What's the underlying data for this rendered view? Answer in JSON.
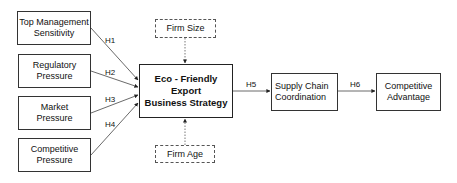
{
  "diagram": {
    "nodes": {
      "top_management": {
        "line1": "Top Management",
        "line2": "Sensitivity"
      },
      "regulatory": {
        "line1": "Regulatory",
        "line2": "Pressure"
      },
      "market": {
        "line1": "Market",
        "line2": "Pressure"
      },
      "competitive_pressure": {
        "line1": "Competitive",
        "line2": "Pressure"
      },
      "eco_strategy": {
        "line1": "Eco - Friendly Export",
        "line2": "Business Strategy"
      },
      "firm_size": {
        "label": "Firm Size"
      },
      "firm_age": {
        "label": "Firm Age"
      },
      "supply_chain": {
        "line1": "Supply Chain",
        "line2": "Coordination"
      },
      "competitive_advantage": {
        "line1": "Competitive",
        "line2": "Advantage"
      }
    },
    "hypotheses": {
      "h1": "H1",
      "h2": "H2",
      "h3": "H3",
      "h4": "H4",
      "h5": "H5",
      "h6": "H6"
    }
  }
}
